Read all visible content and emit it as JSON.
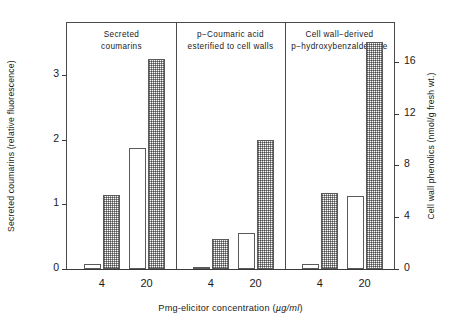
{
  "chart_data": {
    "type": "bar",
    "title": "",
    "xlabel": "Pmg-elicitor concentration (µg/ml)",
    "ylabel_left": "Secreted coumarins (relative fluorescence)",
    "ylabel_right": "Cell wall phenolics (nmol/g fresh wt.)",
    "ylim_left": [
      0,
      3.8
    ],
    "ylim_right": [
      0,
      19
    ],
    "yticks_left": [
      "0",
      "1",
      "2",
      "3"
    ],
    "ytick_values_left": [
      0,
      1,
      2,
      3
    ],
    "yticks_right": [
      "0",
      "4",
      "8",
      "12",
      "16"
    ],
    "ytick_values_right": [
      0,
      4,
      8,
      12,
      16
    ],
    "categories": [
      "4",
      "20"
    ],
    "grid": false,
    "legend": "none",
    "panels": [
      {
        "title_lines": [
          "Secreted",
          "coumarins"
        ],
        "bars": [
          {
            "group": "4",
            "fill": "open",
            "value": 0.08
          },
          {
            "group": "4",
            "fill": "shaded",
            "value": 1.15
          },
          {
            "group": "20",
            "fill": "open",
            "value": 1.87
          },
          {
            "group": "20",
            "fill": "shaded",
            "value": 3.25
          }
        ]
      },
      {
        "title_lines": [
          "p−Coumaric acid",
          "esterified to cell walls"
        ],
        "bars": [
          {
            "group": "4",
            "fill": "open",
            "value": 0.02
          },
          {
            "group": "4",
            "fill": "shaded",
            "value": 0.47
          },
          {
            "group": "20",
            "fill": "open",
            "value": 0.55
          },
          {
            "group": "20",
            "fill": "shaded",
            "value": 1.99
          }
        ]
      },
      {
        "title_lines": [
          "Cell wall−derived",
          "p−hydroxybenzaldehyde"
        ],
        "bars": [
          {
            "group": "4",
            "fill": "open",
            "value": 0.07
          },
          {
            "group": "4",
            "fill": "shaded",
            "value": 1.18
          },
          {
            "group": "20",
            "fill": "open",
            "value": 1.13
          },
          {
            "group": "20",
            "fill": "shaded",
            "value": 3.5
          }
        ]
      }
    ],
    "xtick_labels": [
      "4",
      "20",
      "4",
      "20",
      "4",
      "20"
    ]
  },
  "axes": {
    "left_title": "Secreted coumarins (relative fluorescence)",
    "right_title": "Cell wall phenolics (nmol/g fresh wt.)",
    "x_title_prefix": "Pmg-elicitor concentration (",
    "x_title_unit": "µg/ml",
    "x_title_suffix": ")"
  },
  "colors": {
    "frame": "#4a4a4a",
    "bar_edge": "#5a5a5a",
    "bar_shade": "#8d8d8d",
    "background": "#ffffff",
    "text": "#1a1a1a"
  }
}
